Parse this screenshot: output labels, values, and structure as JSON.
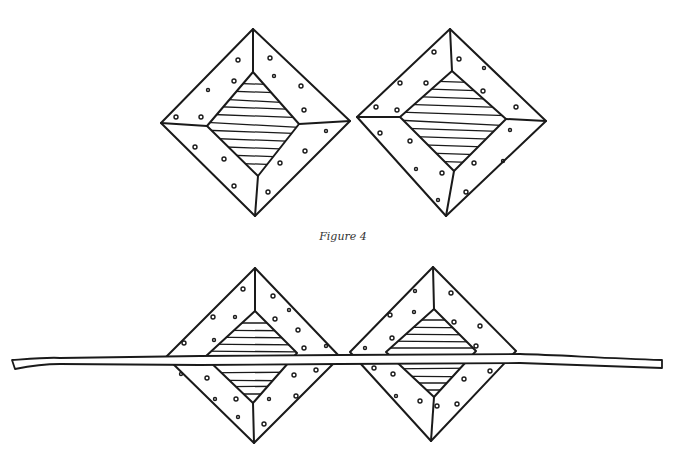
{
  "figure": {
    "caption": "Figure 4",
    "top_row": {
      "description": "Two framed diamond (square-on-point) shapes side by side, each with a dotted outer frame and a horizontally hatched inner diamond"
    },
    "bottom_row": {
      "description": "The same two framed diamonds with a long stick laid horizontally across their centers"
    }
  }
}
